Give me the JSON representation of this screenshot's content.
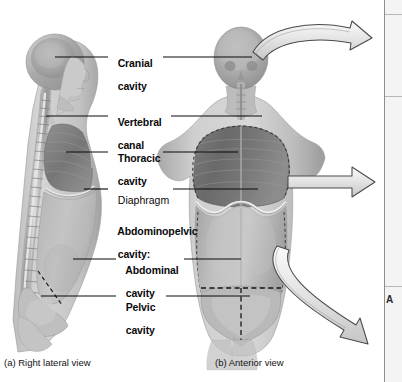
{
  "figure": {
    "background_color": "#ffffff",
    "ink_color": "#0a0a0a"
  },
  "labels": [
    {
      "id": "cranial-cavity",
      "line1": "Cranial",
      "line2": "cavity",
      "bold": true,
      "indent": false,
      "x": 112,
      "y": 51,
      "leader_left": true,
      "leader_right": true
    },
    {
      "id": "vertebral-canal",
      "line1": "Vertebral",
      "line2": "canal",
      "bold": true,
      "indent": false,
      "x": 112,
      "y": 110,
      "leader_left": true,
      "leader_right": true
    },
    {
      "id": "thoracic-cavity",
      "line1": "Thoracic",
      "line2": "cavity",
      "bold": true,
      "indent": false,
      "x": 112,
      "y": 146,
      "leader_left": true,
      "leader_right": true
    },
    {
      "id": "diaphragm",
      "line1": "Diaphragm",
      "line2": "",
      "bold": false,
      "indent": false,
      "x": 112,
      "y": 183,
      "leader_left": true,
      "leader_right": true
    },
    {
      "id": "abdominopelvic-cavity",
      "line1": "Abdominopelvic",
      "line2": "cavity:",
      "bold": true,
      "indent": false,
      "x": 112,
      "y": 219,
      "leader_left": false,
      "leader_right": false
    },
    {
      "id": "abdominal-cavity",
      "line1": "Abdominal",
      "line2": "cavity",
      "bold": true,
      "indent": true,
      "x": 120,
      "y": 254,
      "leader_left": true,
      "leader_right": true
    },
    {
      "id": "pelvic-cavity",
      "line1": "Pelvic",
      "line2": "cavity",
      "bold": true,
      "indent": true,
      "x": 120,
      "y": 291,
      "leader_left": true,
      "leader_right": true
    }
  ],
  "captions": {
    "lateral": "(a) Right lateral view",
    "anterior": "(b) Anterior view"
  },
  "arrows": [
    {
      "id": "arrow-cranial",
      "shape": "curved-up",
      "from": "head",
      "to": "right-panel"
    },
    {
      "id": "arrow-thoracic",
      "shape": "straight",
      "from": "thorax",
      "to": "right-panel"
    },
    {
      "id": "arrow-pelvic",
      "shape": "curved-down",
      "from": "pelvis",
      "to": "right-panel"
    }
  ],
  "side_panel": {
    "visible_text": "A",
    "background": "#f4f4f4",
    "border_color": "#8d8d8d"
  }
}
